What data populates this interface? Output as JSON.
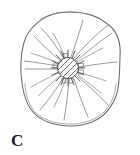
{
  "figure": {
    "panel_label": "C",
    "caption_text": "C",
    "illustration_name": "radiating-spicule-specimen-drawing",
    "background_color": "#ffffff",
    "line_color": "#5a5a5a",
    "outline_color": "#6b6b6b",
    "hatch_color": "#4a4a4a",
    "label_color": "#1c1c1c"
  },
  "diagram_data": {
    "type": "line-drawing",
    "description": "Irregular rounded body outline enclosing a hatched central core with numerous radiating lines",
    "canvas": {
      "width": 140,
      "height": 155
    },
    "outer_body": {
      "name": "body-outline",
      "center": [
        70,
        68
      ],
      "radius_x": 49,
      "radius_y": 58,
      "bounds": {
        "left": 21,
        "right": 120,
        "top": 12,
        "bottom": 126
      }
    },
    "inner_rim": {
      "name": "basal-inner-rim",
      "span": "lower arc",
      "offset": 7
    },
    "central_core": {
      "name": "hatched-nucleus",
      "center": [
        68,
        68
      ],
      "radius": 11,
      "hatch_angle_deg": 45,
      "hatch_line_count": 9,
      "spike_count": 18
    },
    "radiating_lines": {
      "name": "radial-spicules",
      "count": 26,
      "short_count": 16,
      "long_count": 10,
      "notes": "Short spikes ring the core; long curved lines sweep outward toward the body outline"
    }
  }
}
